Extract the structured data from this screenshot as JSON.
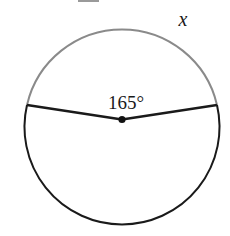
{
  "diagram": {
    "type": "circle-central-angle",
    "circle": {
      "center": {
        "x": 122,
        "y": 119.5
      },
      "radius": 97.5
    },
    "chord_points": {
      "left": {
        "x": 27,
        "y": 105
      },
      "right": {
        "x": 217,
        "y": 105
      }
    },
    "central_angle_label": "165°",
    "arc_label": "x",
    "colors": {
      "minor_arc": "#8a8a8a",
      "major_arc": "#1a1a1a",
      "radii": "#1a1a1a",
      "center_dot": "#111111",
      "text": "#1a1a1a",
      "top_bar": "#9a9a9a"
    }
  }
}
